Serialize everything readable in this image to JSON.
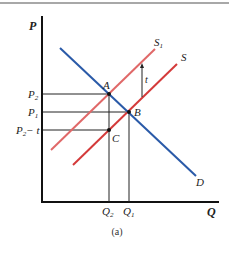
{
  "figure": {
    "caption": "(a)",
    "axes": {
      "y_label": "P",
      "x_label": "Q"
    },
    "price_labels": {
      "p2": "P",
      "p2_sub": "2",
      "p1": "P",
      "p1_sub": "1",
      "p2t": "P",
      "p2t_sub": "2",
      "p2t_suffix": "− t"
    },
    "quantity_labels": {
      "q2": "Q",
      "q2_sub": "2",
      "q1": "Q",
      "q1_sub": "1"
    },
    "curves": {
      "demand": {
        "label": "D",
        "color": "#2a5aa8"
      },
      "supply": {
        "label": "S",
        "color": "#d43a3a"
      },
      "supply_shifted": {
        "label": "S",
        "label_sub": "1",
        "color": "#e06868"
      }
    },
    "points": {
      "a": "A",
      "b": "B",
      "c": "C"
    },
    "tax_label": "t"
  }
}
